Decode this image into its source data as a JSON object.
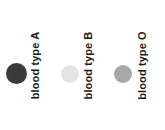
{
  "figure": {
    "type": "legend",
    "background_color": "#ffffff",
    "orientation": "horizontal",
    "label_rotation_degrees": -90,
    "label_font_weight": "bold",
    "label_color": "#1a1a1a"
  },
  "legend": {
    "entries": [
      {
        "label": "blood type A",
        "marker": "filled-circle",
        "color": "#3a3a3a",
        "size_px": 21
      },
      {
        "label": "blood type B",
        "marker": "filled-circle",
        "color": "#e4e4e4",
        "size_px": 18
      },
      {
        "label": "blood type O",
        "marker": "filled-circle",
        "color": "#a8a8a8",
        "size_px": 18
      }
    ]
  },
  "chart_data": {
    "type": "table",
    "title": "",
    "xlabel": "",
    "ylabel": "",
    "categories": [
      "blood type A",
      "blood type B",
      "blood type O"
    ],
    "series": [
      {
        "name": "swatch color",
        "values": [
          "#3a3a3a",
          "#e4e4e4",
          "#a8a8a8"
        ]
      }
    ],
    "legend_position": "inline",
    "grid": false
  }
}
